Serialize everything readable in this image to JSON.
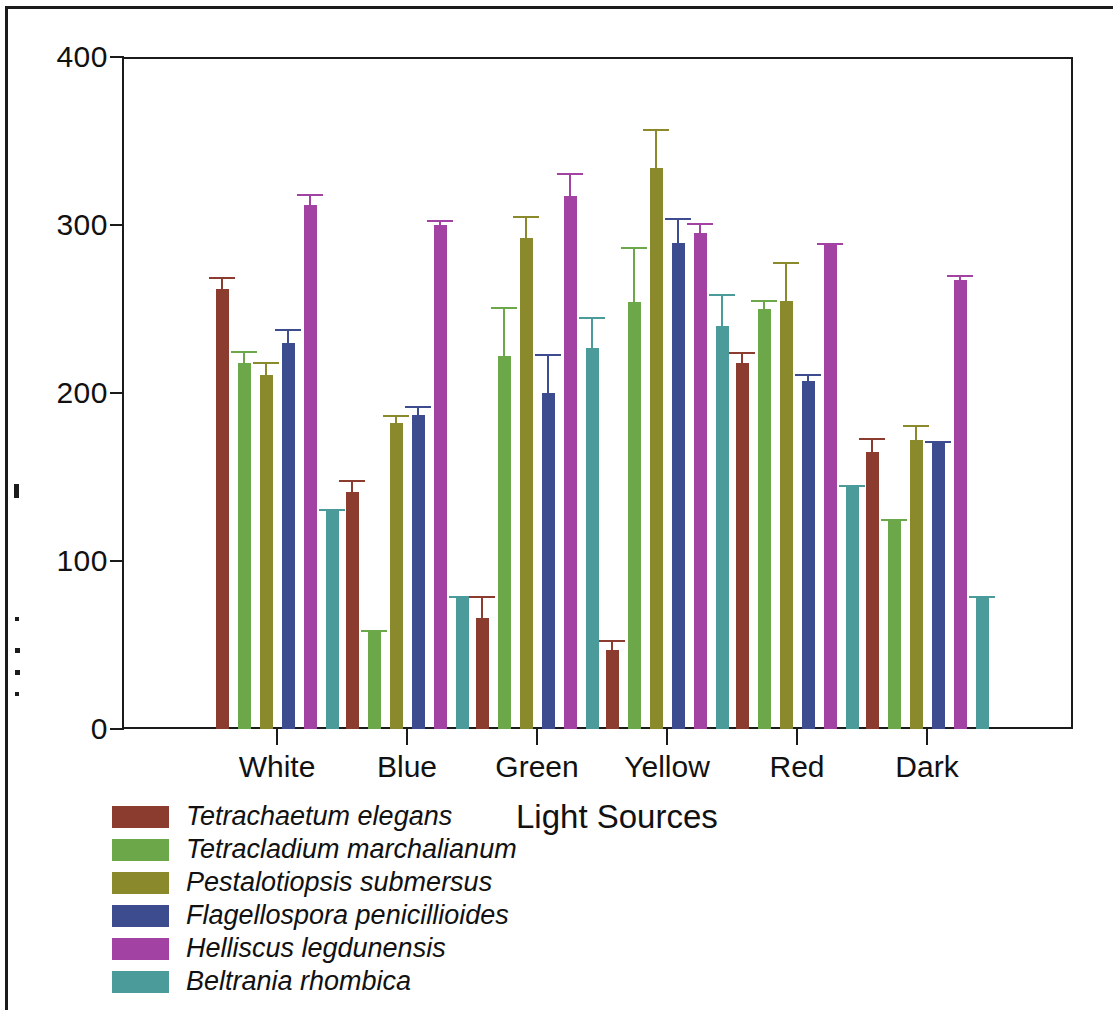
{
  "chart_data": {
    "type": "bar",
    "title": "",
    "xlabel": "Light Sources",
    "ylabel": "",
    "ylim": [
      0,
      400
    ],
    "yticks": [
      0,
      100,
      200,
      300,
      400
    ],
    "grid": false,
    "legend_position": "below-left",
    "error_bars": "upper only",
    "categories": [
      "White",
      "Blue",
      "Green",
      "Yellow",
      "Red",
      "Dark"
    ],
    "series": [
      {
        "name": "Tetrachaetum elegans",
        "color": "#8c3b2f",
        "values": [
          262,
          141,
          66,
          47,
          218,
          165
        ],
        "errors": [
          6,
          6,
          12,
          5,
          5,
          7
        ]
      },
      {
        "name": "Tetracladium marchalianum",
        "color": "#6ca84a",
        "values": [
          218,
          58,
          222,
          254,
          250,
          124
        ],
        "errors": [
          6,
          0,
          28,
          32,
          4,
          0
        ]
      },
      {
        "name": "Pestalotiopsis submersus",
        "color": "#8a8a2c",
        "values": [
          211,
          182,
          292,
          334,
          255,
          172
        ],
        "errors": [
          6,
          4,
          12,
          22,
          22,
          8
        ]
      },
      {
        "name": "Flagellospora penicillioides",
        "color": "#3d4b8f",
        "values": [
          230,
          187,
          200,
          289,
          207,
          170
        ],
        "errors": [
          7,
          4,
          22,
          14,
          3,
          0
        ]
      },
      {
        "name": "Helliscus legdunensis",
        "color": "#a243a4",
        "values": [
          312,
          300,
          317,
          295,
          288,
          267
        ],
        "errors": [
          5,
          2,
          13,
          5,
          0,
          2
        ]
      },
      {
        "name": "Beltrania rhombica",
        "color": "#4b9b9b",
        "values": [
          130,
          78,
          227,
          240,
          144,
          78
        ],
        "errors": [
          0,
          0,
          17,
          18,
          0,
          0
        ]
      }
    ]
  },
  "axes": {
    "y_tick_labels": [
      "400",
      "300",
      "200",
      "100",
      "0"
    ],
    "x_tick_labels": [
      "White",
      "Blue",
      "Green",
      "Yellow",
      "Red",
      "Dark"
    ],
    "x_axis_title": "Light Sources"
  },
  "legend": {
    "items": [
      {
        "label": "Tetrachaetum elegans",
        "color": "#8c3b2f"
      },
      {
        "label": "Tetracladium marchalianum",
        "color": "#6ca84a"
      },
      {
        "label": "Pestalotiopsis submersus",
        "color": "#8a8a2c"
      },
      {
        "label": "Flagellospora penicillioides",
        "color": "#3d4b8f"
      },
      {
        "label": "Helliscus legdunensis",
        "color": "#a243a4"
      },
      {
        "label": "Beltrania rhombica",
        "color": "#4b9b9b"
      }
    ]
  }
}
